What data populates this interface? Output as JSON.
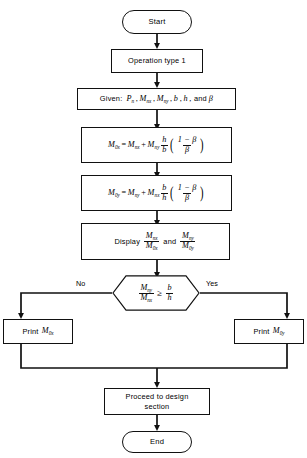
{
  "diagram": {
    "stroke_color": "#111111",
    "background_color": "#ffffff"
  },
  "nodes": {
    "start": {
      "label": "Start",
      "shape": "terminator"
    },
    "operation": {
      "label": "Operation type 1",
      "shape": "process"
    },
    "given": {
      "shape": "process",
      "prefix": "Given:",
      "vars": [
        "P",
        "M",
        "M",
        "b",
        "h",
        "and"
      ],
      "text": "Given:  P n , M nx , M ny , b, h, and β",
      "p_base": "P",
      "p_sub": "n",
      "mx_base": "M",
      "mx_sub": "nx",
      "my_base": "M",
      "my_sub": "ny",
      "b": "b",
      "h": "h",
      "and": "and",
      "beta": "β",
      "comma": ",",
      "comma2": ",",
      "comma3": ",",
      "comma4": ","
    },
    "eq_mox": {
      "shape": "process",
      "lhs_base": "M",
      "lhs_sub": "0x",
      "eq": "=",
      "t1_base": "M",
      "t1_sub": "nx",
      "plus": "+",
      "t2_base": "M",
      "t2_sub": "ny",
      "frac_num": "h",
      "frac_den": "b",
      "inner_num": "1 − β",
      "inner_den": "β",
      "text": "M0x = Mnx + Mny (h/b)((1−β)/β)"
    },
    "eq_moy": {
      "shape": "process",
      "lhs_base": "M",
      "lhs_sub": "0y",
      "eq": "=",
      "t1_base": "M",
      "t1_sub": "ny",
      "plus": "+",
      "t2_base": "M",
      "t2_sub": "nx",
      "frac_num": "b",
      "frac_den": "h",
      "inner_num": "1 − β",
      "inner_den": "β",
      "text": "M0y = Mny + Mnx (b/h)((1−β)/β)"
    },
    "display": {
      "shape": "process",
      "verb": "Display",
      "f1_num_base": "M",
      "f1_num_sub": "nx",
      "f1_den_base": "M",
      "f1_den_sub": "0x",
      "conj": "and",
      "f2_num_base": "M",
      "f2_num_sub": "ny",
      "f2_den_base": "M",
      "f2_den_sub": "0y",
      "text": "Display Mnx/M0x and Mny/M0y"
    },
    "decision": {
      "shape": "decision",
      "num_base": "M",
      "num_sub": "ny",
      "den_base": "M",
      "den_sub": "nx",
      "operator": "≥",
      "rhs_num": "b",
      "rhs_den": "h",
      "text": "Mny/Mnx ≥ b/h",
      "no_label": "No",
      "yes_label": "Yes"
    },
    "print_left": {
      "shape": "process",
      "verb": "Print",
      "base": "M",
      "sub": "0x",
      "text": "Print M0x"
    },
    "print_right": {
      "shape": "process",
      "verb": "Print",
      "base": "M",
      "sub": "0y",
      "text": "Print M0y"
    },
    "proceed": {
      "shape": "process",
      "line1": "Proceed to design",
      "line2": "section",
      "text": "Proceed to design section"
    },
    "end": {
      "label": "End",
      "shape": "terminator"
    }
  }
}
